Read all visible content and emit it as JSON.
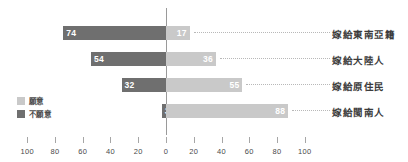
{
  "chart_data": {
    "type": "bar",
    "subtype": "diverging-horizontal-bar",
    "title": "",
    "xlabel": "",
    "ylabel": "",
    "xlim": [
      -100,
      100
    ],
    "grid": false,
    "legend_position": "left-inside",
    "categories": [
      "嫁給東南亞籍",
      "嫁給大陸人",
      "嫁給原住民",
      "嫁給閩南人"
    ],
    "series": [
      {
        "name": "不願意",
        "color": "#6f6f6f",
        "direction": "left",
        "values": [
          74,
          54,
          32,
          3
        ]
      },
      {
        "name": "願意",
        "color": "#c9c9c9",
        "direction": "right",
        "values": [
          17,
          36,
          55,
          88
        ]
      }
    ],
    "tick_labels": [
      "100",
      "80",
      "60",
      "40",
      "20",
      "0",
      "20",
      "40",
      "60",
      "80",
      "100"
    ],
    "tick_values": [
      -100,
      -80,
      -60,
      -40,
      -20,
      0,
      20,
      40,
      60,
      80,
      100
    ],
    "rows": [
      {
        "category": "嫁給東南亞籍",
        "unwilling": 74,
        "willing": 17
      },
      {
        "category": "嫁給大陸人",
        "unwilling": 54,
        "willing": 36
      },
      {
        "category": "嫁給原住民",
        "unwilling": 32,
        "willing": 55
      },
      {
        "category": "嫁給閩南人",
        "unwilling": 3,
        "willing": 88
      }
    ]
  },
  "legend": {
    "items": [
      {
        "label": "願意",
        "color": "#c9c9c9"
      },
      {
        "label": "不願意",
        "color": "#6f6f6f"
      }
    ]
  },
  "axis": {
    "ticks": [
      {
        "label": "100"
      },
      {
        "label": "80"
      },
      {
        "label": "60"
      },
      {
        "label": "40"
      },
      {
        "label": "20"
      },
      {
        "label": "0"
      },
      {
        "label": "20"
      },
      {
        "label": "40"
      },
      {
        "label": "60"
      },
      {
        "label": "80"
      },
      {
        "label": "100"
      }
    ]
  }
}
